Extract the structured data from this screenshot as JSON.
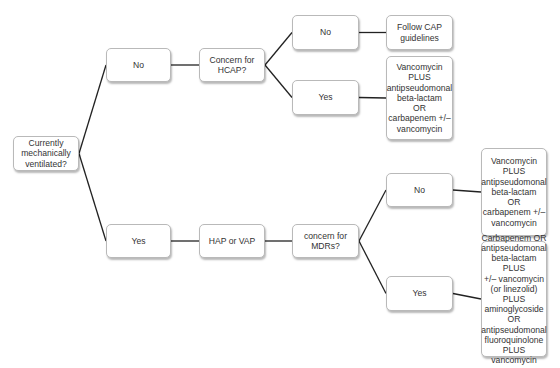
{
  "diagram": {
    "type": "decision-tree",
    "line_color": "#222222",
    "nodes": [
      {
        "id": "root",
        "text": "Currently\nmechanically\nventilated?"
      },
      {
        "id": "no1",
        "text": "No"
      },
      {
        "id": "yes1",
        "text": "Yes"
      },
      {
        "id": "hcap",
        "text": "Concern for\nHCAP?"
      },
      {
        "id": "hcap_no",
        "text": "No"
      },
      {
        "id": "hcap_yes",
        "text": "Yes"
      },
      {
        "id": "cap",
        "text": "Follow CAP\nguidelines"
      },
      {
        "id": "vanc1",
        "text": "Vancomycin\nPLUS\nantipseudomonal\nbeta-lactam\nOR\ncarbapenem +/–\nvancomycin"
      },
      {
        "id": "hapvap",
        "text": "HAP or VAP"
      },
      {
        "id": "mdr",
        "text": "concern for\nMDRs?"
      },
      {
        "id": "mdr_no",
        "text": "No"
      },
      {
        "id": "mdr_yes",
        "text": "Yes"
      },
      {
        "id": "vanc2",
        "text": "Vancomycin\nPLUS\nantipseudomonal\nbeta-lactam\nOR\ncarbapenem +/–\nvancomycin"
      },
      {
        "id": "combo",
        "text": "Carbapenem OR\nantipseudomonal\nbeta-lactam PLUS\n+/– vancomycin\n(or linezolid) PLUS\naminoglycoside\nOR\nantipseudomonal\nfluoroquinolone\nPLUS\nvancomycin"
      }
    ],
    "edges": [
      [
        "root",
        "no1"
      ],
      [
        "root",
        "yes1"
      ],
      [
        "no1",
        "hcap"
      ],
      [
        "hcap",
        "hcap_no"
      ],
      [
        "hcap",
        "hcap_yes"
      ],
      [
        "hcap_no",
        "cap"
      ],
      [
        "hcap_yes",
        "vanc1"
      ],
      [
        "yes1",
        "hapvap"
      ],
      [
        "hapvap",
        "mdr"
      ],
      [
        "mdr",
        "mdr_no"
      ],
      [
        "mdr",
        "mdr_yes"
      ],
      [
        "mdr_no",
        "vanc2"
      ],
      [
        "mdr_yes",
        "combo"
      ]
    ]
  }
}
